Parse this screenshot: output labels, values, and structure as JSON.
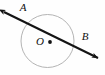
{
  "figure": {
    "canvas": {
      "width": 105,
      "height": 75,
      "background": "#fefefe"
    },
    "colors": {
      "circle_stroke": "#b4b4b4",
      "line_stroke": "#141414",
      "label_color": "#111111",
      "center_dot": "#111111"
    },
    "circle": {
      "name": "circle-O",
      "center_x": 47.5,
      "center_y": 41,
      "radius": 26.5,
      "stroke_width": 1
    },
    "center_point": {
      "label": "O",
      "dot_x": 50,
      "dot_y": 42,
      "dot_radius": 1.9,
      "label_x": 40,
      "label_y": 45,
      "font_size": 11
    },
    "secant_line": {
      "name": "secant-AB",
      "x1": 4,
      "y1": 12,
      "x2": 98,
      "y2": 58,
      "stroke_width": 2.1,
      "arrow_start": true,
      "arrow_end": true
    },
    "labels": [
      {
        "text": "A",
        "x": 23,
        "y": 11,
        "font_size": 11
      },
      {
        "text": "B",
        "x": 85,
        "y": 40,
        "font_size": 11
      }
    ]
  }
}
